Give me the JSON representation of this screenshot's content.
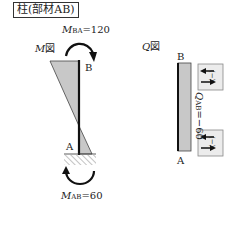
{
  "title": "柱(部材AB)",
  "m_diagram": {
    "label_italic": "M",
    "label_rest": "図",
    "top_moment": {
      "symbol": "M",
      "subscript": "BA",
      "value_text": "=120"
    },
    "bottom_moment": {
      "symbol": "M",
      "subscript": "AB",
      "value_text": "=60"
    },
    "node_top": "B",
    "node_bottom": "A"
  },
  "q_diagram": {
    "label_italic": "Q",
    "label_rest": "図",
    "node_top": "B",
    "node_bottom": "A",
    "shear": {
      "symbol": "Q",
      "subscript": "AB",
      "value_text": "=−60"
    },
    "sign_top": "(−)",
    "sign_bottom": "(−)"
  },
  "colors": {
    "fill": "#c8c8c8",
    "line": "#111111"
  }
}
